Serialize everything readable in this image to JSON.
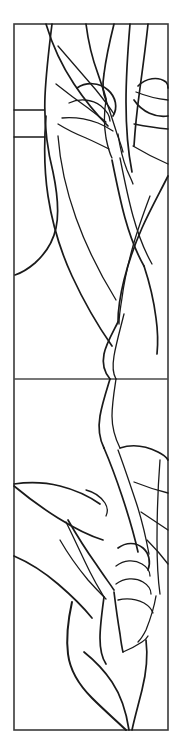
{
  "artwork": {
    "title": "Stained Glass Leaf Panel Pattern",
    "kind": "line-art-pattern",
    "description": "Two-panel vertical stained glass cartoon of stylized leaves, buds and flowing stems rendered as black outlines on white.",
    "canvas": {
      "width": 182,
      "height": 750,
      "background_color": "#ffffff"
    },
    "colors": {
      "line": "#1a1a1a",
      "frame": "#3a3a3a",
      "divider": "#4a4a4a",
      "glass_fill": "#ffffff"
    },
    "frame": {
      "left": 14,
      "top": 24,
      "right": 168,
      "bottom": 730,
      "stroke_width": 1.6
    },
    "divider": {
      "orientation": "horizontal",
      "y": 379,
      "x_start": 14,
      "x_end": 168,
      "stroke_width": 1.5
    },
    "panels": [
      {
        "name": "upper-panel",
        "top": 24,
        "bottom": 379,
        "motif": "overlapping pointed leaves with bud cluster at upper left and sweeping stems"
      },
      {
        "name": "lower-panel",
        "top": 379,
        "bottom": 730,
        "motif": "broad leaf blades, segmented bud at right, curving stem sweeping to lower right corner"
      }
    ],
    "strokes": {
      "heavy": 2.0,
      "medium": 1.7,
      "thin": 1.3
    }
  },
  "shapes": {
    "upper": [
      {
        "name": "left-vertical-stem",
        "weight": "lead-mid",
        "d": "M 52 24 C 49 48, 46 74, 45 96 C 44 120, 47 148, 53 172 C 58 196, 59 214, 56 228 C 53 242, 45 254, 35 263 C 28 269, 21 273, 15 275"
      },
      {
        "name": "left-upper-leaf-outer",
        "weight": "lead-mid",
        "d": "M 46 24 C 52 44, 62 66, 74 84 C 86 102, 98 116, 108 126"
      },
      {
        "name": "left-leaf-spine-a",
        "weight": "lead-thin",
        "d": "M 58 46 C 70 60, 84 76, 96 90 C 104 100, 110 108, 114 114"
      },
      {
        "name": "left-leaf-tip-fold",
        "weight": "lead-thin",
        "d": "M 56 84 C 66 92, 78 101, 88 108 C 96 114, 102 119, 106 122"
      },
      {
        "name": "bud-left-cap",
        "weight": "lead-mid",
        "d": "M 77 88 C 86 82, 99 82, 108 90 C 116 97, 118 108, 113 116"
      },
      {
        "name": "bud-left-inner",
        "weight": "lead-thin",
        "d": "M 69 103 C 79 98, 92 99, 101 106 C 107 111, 110 117, 110 121"
      },
      {
        "name": "bud-left-base",
        "weight": "lead-thin",
        "d": "M 62 118 C 73 117, 87 119, 98 123 C 105 126, 110 129, 113 131"
      },
      {
        "name": "bud-left-socket",
        "weight": "lead-thin",
        "d": "M 58 124 C 66 129, 76 134, 86 138 C 95 142, 103 146, 109 149"
      },
      {
        "name": "left-edge-notch-upper",
        "weight": "lead-thin",
        "d": "M 14 110 C 24 110, 34 110, 44 110"
      },
      {
        "name": "left-edge-notch-lower",
        "weight": "lead-thin",
        "d": "M 14 137 C 24 137, 34 137, 45 137"
      },
      {
        "name": "left-lower-leaf-outer",
        "weight": "lead-mid",
        "d": "M 46 116 C 44 142, 44 170, 48 196 C 52 222, 60 250, 72 276 C 84 302, 98 326, 112 346"
      },
      {
        "name": "left-lower-leaf-inner",
        "weight": "lead-thin",
        "d": "M 58 136 C 60 162, 66 190, 76 218 C 86 246, 100 274, 116 300"
      },
      {
        "name": "center-petal-left",
        "weight": "lead-mid",
        "d": "M 86 24 C 88 40, 92 58, 98 74 C 102 86, 105 94, 106 99"
      },
      {
        "name": "center-petal-right",
        "weight": "lead-mid",
        "d": "M 114 24 C 110 40, 106 58, 104 74 C 102 86, 103 94, 106 100"
      },
      {
        "name": "center-vein-a",
        "weight": "lead-thin",
        "d": "M 106 100 C 110 112, 114 124, 117 134 C 120 142, 122 148, 123 152"
      },
      {
        "name": "center-vein-b",
        "weight": "lead-thin",
        "d": "M 106 100 C 104 112, 104 126, 106 138 C 108 148, 110 154, 112 158"
      },
      {
        "name": "right-long-leaf-outer",
        "weight": "lead-mid",
        "d": "M 130 24 C 128 48, 126 76, 126 102 C 126 128, 128 152, 132 172"
      },
      {
        "name": "right-long-leaf-inner",
        "weight": "lead-thin",
        "d": "M 118 134 C 120 148, 123 160, 127 170 C 130 177, 132 181, 133 184"
      },
      {
        "name": "right-second-leaf",
        "weight": "lead-mid",
        "d": "M 148 24 C 146 44, 143 66, 140 88 C 137 110, 135 130, 134 146"
      },
      {
        "name": "right-petal-oval-top",
        "weight": "lead-mid",
        "d": "M 138 86 C 146 78, 158 76, 166 82 C 168 84, 168 86, 168 88"
      },
      {
        "name": "right-petal-oval-bottom",
        "weight": "lead-mid",
        "d": "M 134 100 C 142 112, 156 118, 168 116"
      },
      {
        "name": "right-petal-oval-mid",
        "weight": "lead-thin",
        "d": "M 136 92 C 146 96, 158 99, 168 100"
      },
      {
        "name": "right-panel-divider-a",
        "weight": "lead-thin",
        "d": "M 134 124 C 144 126, 156 128, 168 129"
      },
      {
        "name": "right-panel-divider-b",
        "weight": "lead-thin",
        "d": "M 133 146 C 143 152, 154 158, 168 164"
      },
      {
        "name": "mid-sweep-stem",
        "weight": "lead-mid",
        "d": "M 112 160 C 116 180, 120 200, 125 218 C 130 236, 136 252, 144 266"
      },
      {
        "name": "mid-sweep-stem-shadow",
        "weight": "lead-thin",
        "d": "M 120 158 C 124 178, 128 198, 133 216 C 138 234, 144 250, 152 264"
      },
      {
        "name": "right-lower-blade-outer",
        "weight": "lead-mid",
        "d": "M 168 176 C 160 192, 150 210, 142 228 C 134 246, 128 264, 124 280 C 120 296, 118 310, 118 322"
      },
      {
        "name": "right-lower-blade-inner",
        "weight": "lead-thin",
        "d": "M 150 196 C 144 212, 138 228, 133 246 C 128 264, 124 282, 122 298 C 120 310, 119 318, 119 324"
      },
      {
        "name": "right-lower-blade-tail",
        "weight": "lead-mid",
        "d": "M 144 266 C 150 284, 154 302, 156 318 C 158 332, 158 344, 157 354"
      },
      {
        "name": "long-s-stem-upper",
        "weight": "lead-mid",
        "d": "M 118 322 C 112 334, 106 344, 104 354 C 102 364, 104 372, 110 379"
      },
      {
        "name": "s-stem-to-divider",
        "weight": "lead-thin",
        "d": "M 124 314 C 120 330, 116 344, 114 356 C 112 368, 113 374, 116 379"
      }
    ],
    "lower": [
      {
        "name": "s-stem-continue-left",
        "weight": "lead-mid",
        "d": "M 110 379 C 106 392, 102 404, 100 416 C 98 428, 99 438, 104 448"
      },
      {
        "name": "s-stem-continue-right",
        "weight": "lead-thin",
        "d": "M 116 379 C 114 392, 112 404, 112 416 C 112 428, 115 438, 120 448"
      },
      {
        "name": "lower-right-blade-outer",
        "weight": "lead-mid",
        "d": "M 104 448 C 110 462, 116 478, 122 496 C 128 514, 134 534, 138 552"
      },
      {
        "name": "lower-right-blade-inner",
        "weight": "lead-thin",
        "d": "M 118 450 C 124 466, 130 484, 136 502 C 142 520, 146 538, 149 554"
      },
      {
        "name": "lower-right-blade-upper-edge",
        "weight": "lead-mid",
        "d": "M 120 448 C 132 444, 146 446, 158 452 C 164 455, 167 458, 168 460"
      },
      {
        "name": "right-seg-line-a",
        "weight": "lead-thin",
        "d": "M 134 482 C 144 486, 156 490, 168 493"
      },
      {
        "name": "right-seg-line-b",
        "weight": "lead-thin",
        "d": "M 141 512 C 150 518, 159 524, 168 530"
      },
      {
        "name": "right-seg-line-c",
        "weight": "lead-thin",
        "d": "M 147 540 C 155 548, 162 556, 168 564"
      },
      {
        "name": "right-edge-vertical",
        "weight": "lead-thin",
        "d": "M 160 460 C 158 486, 157 514, 157 540 C 157 562, 158 580, 160 594"
      },
      {
        "name": "left-broad-leaf-top",
        "weight": "lead-mid",
        "d": "M 14 484 C 28 482, 44 482, 60 486 C 76 490, 90 497, 100 504"
      },
      {
        "name": "left-broad-leaf-bottom",
        "weight": "lead-mid",
        "d": "M 14 486 C 26 496, 42 508, 58 518 C 74 528, 90 536, 103 540"
      },
      {
        "name": "left-broad-leaf-tip",
        "weight": "lead-thin",
        "d": "M 86 490 C 94 492, 101 497, 105 503 C 108 508, 108 512, 106 516"
      },
      {
        "name": "left-mid-leaf-outer",
        "weight": "lead-mid",
        "d": "M 68 520 C 76 534, 86 550, 96 564 C 104 576, 110 584, 114 590"
      },
      {
        "name": "left-mid-leaf-inner",
        "weight": "lead-thin",
        "d": "M 60 540 C 68 554, 78 568, 88 580 C 96 589, 102 595, 106 599"
      },
      {
        "name": "left-lower-leaf-blade",
        "weight": "lead-mid",
        "d": "M 14 556 C 28 562, 44 572, 58 584 C 72 596, 84 608, 92 618"
      },
      {
        "name": "leaf-junction-knot",
        "weight": "lead-thin",
        "d": "M 66 522 C 74 538, 82 556, 90 572 C 96 584, 101 592, 104 597"
      },
      {
        "name": "bud-right-outer",
        "weight": "lead-mid",
        "d": "M 118 548 C 126 542, 136 542, 143 548 C 149 553, 151 562, 148 570"
      },
      {
        "name": "bud-right-seg1",
        "weight": "lead-thin",
        "d": "M 116 566 C 124 560, 134 559, 142 564 C 147 567, 150 572, 150 576"
      },
      {
        "name": "bud-right-seg2",
        "weight": "lead-thin",
        "d": "M 116 584 C 124 578, 135 577, 143 582 C 148 585, 151 590, 151 594"
      },
      {
        "name": "bud-right-base",
        "weight": "lead-thin",
        "d": "M 118 600 C 126 598, 136 599, 144 603 C 149 606, 152 610, 153 613"
      },
      {
        "name": "bud-right-stem",
        "weight": "lead-mid",
        "d": "M 114 592 C 116 608, 118 622, 120 634 C 121 642, 122 648, 123 652"
      },
      {
        "name": "center-curve-down",
        "weight": "lead-mid",
        "d": "M 104 597 C 102 612, 100 626, 100 638 C 100 650, 102 658, 106 664"
      },
      {
        "name": "big-sweep-left",
        "weight": "lead-heavy",
        "d": "M 72 602 C 68 620, 66 638, 68 654 C 70 670, 78 684, 92 698 C 106 712, 118 722, 126 730"
      },
      {
        "name": "big-sweep-inner",
        "weight": "lead-mid",
        "d": "M 84 652 C 94 660, 104 670, 112 682 C 120 694, 126 710, 129 730"
      },
      {
        "name": "big-sweep-right",
        "weight": "lead-mid",
        "d": "M 146 640 C 148 656, 146 674, 142 690 C 138 706, 134 720, 132 730"
      },
      {
        "name": "bottom-stem-meet",
        "weight": "lead-thin",
        "d": "M 123 652 C 128 650, 136 646, 142 642 C 145 640, 147 638, 148 636"
      },
      {
        "name": "lower-right-tail",
        "weight": "lead-thin",
        "d": "M 156 596 C 154 608, 150 620, 146 630 C 143 636, 140 640, 138 642"
      }
    ]
  }
}
